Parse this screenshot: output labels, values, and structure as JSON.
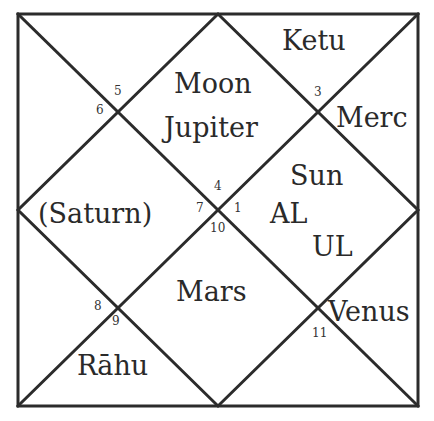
{
  "chart": {
    "type": "north-indian-rasi-chart",
    "line_color": "#2b2b2b",
    "background": "#ffffff"
  },
  "houses": {
    "h1": {
      "sign_number": "1",
      "planets": [
        "Sun",
        "AL",
        "UL"
      ]
    },
    "h2": {
      "sign_number": "3",
      "planets": [
        "Ketu"
      ]
    },
    "h3": {
      "sign_number": "3",
      "planets": [
        "Merc"
      ]
    },
    "h4": {
      "sign_number": "4",
      "planets": [
        "Moon",
        "Jupiter"
      ]
    },
    "h5": {
      "sign_number": "5",
      "planets": []
    },
    "h6": {
      "sign_number": "6",
      "planets": []
    },
    "h7": {
      "sign_number": "7",
      "planets": [
        "(Saturn)"
      ]
    },
    "h8": {
      "sign_number": "8",
      "planets": []
    },
    "h9": {
      "sign_number": "9",
      "planets": [
        "Rāhu"
      ]
    },
    "h10": {
      "sign_number": "10",
      "planets": [
        "Mars"
      ]
    },
    "h11": {
      "sign_number": "11",
      "planets": [
        "Venus"
      ]
    }
  },
  "labels": {
    "ketu": "Ketu",
    "moon": "Moon",
    "jupiter": "Jupiter",
    "merc": "Merc",
    "sun": "Sun",
    "al": "AL",
    "ul": "UL",
    "saturn": "(Saturn)",
    "mars": "Mars",
    "venus": "Venus",
    "rahu": "Rāhu"
  },
  "sign_numbers": {
    "n1": "1",
    "n3": "3",
    "n4": "4",
    "n5": "5",
    "n6": "6",
    "n7": "7",
    "n8": "8",
    "n9": "9",
    "n10": "10",
    "n11": "11"
  }
}
